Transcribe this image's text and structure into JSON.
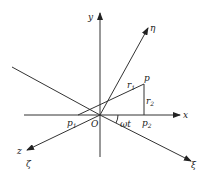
{
  "diagram": {
    "axes": {
      "x": "x",
      "y": "y",
      "z": "z",
      "xi": "ξ",
      "eta": "η",
      "zeta": "ζ"
    },
    "origin_label": "O",
    "points": {
      "p": "p",
      "p1_base": "p",
      "p1_sub": "1",
      "p2_base": "p",
      "p2_sub": "2"
    },
    "segments": {
      "r1_base": "r",
      "r1_sub": "1",
      "r2_base": "r",
      "r2_sub": "2"
    },
    "angle_label": "ωt",
    "colors": {
      "stroke": "#333333",
      "text": "#222222",
      "background": "#ffffff"
    }
  }
}
